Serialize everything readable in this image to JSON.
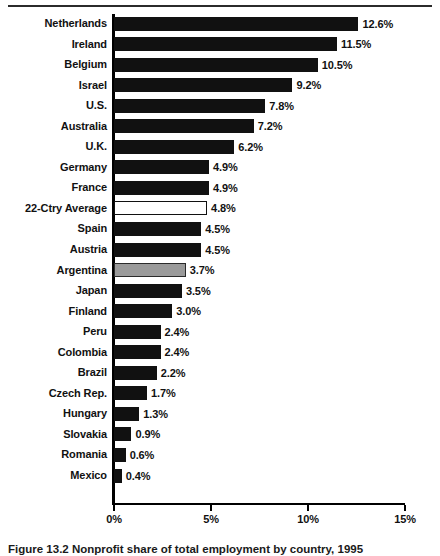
{
  "figure": {
    "caption": "Figure 13.2  Nonprofit share of total employment by country, 1995",
    "top_rule": "horizontal-rule",
    "bottom_rule": "horizontal-rule"
  },
  "chart_data": {
    "type": "bar",
    "orientation": "horizontal",
    "title": "",
    "subtitle": "",
    "xlabel": "",
    "ylabel": "",
    "xlim": [
      0,
      15
    ],
    "xticks": [
      0,
      5,
      10,
      15
    ],
    "xtick_labels": [
      "0%",
      "5%",
      "10%",
      "15%"
    ],
    "grid": false,
    "legend": "none",
    "value_suffix": "%",
    "categories": [
      "Netherlands",
      "Ireland",
      "Belgium",
      "Israel",
      "U.S.",
      "Australia",
      "U.K.",
      "Germany",
      "France",
      "22-Ctry Average",
      "Spain",
      "Austria",
      "Argentina",
      "Japan",
      "Finland",
      "Peru",
      "Colombia",
      "Brazil",
      "Czech Rep.",
      "Hungary",
      "Slovakia",
      "Romania",
      "Mexico"
    ],
    "values": [
      12.6,
      11.5,
      10.5,
      9.2,
      7.8,
      7.2,
      6.2,
      4.9,
      4.9,
      4.8,
      4.5,
      4.5,
      3.7,
      3.5,
      3.0,
      2.4,
      2.4,
      2.2,
      1.7,
      1.3,
      0.9,
      0.6,
      0.4
    ],
    "value_labels": [
      "12.6%",
      "11.5%",
      "10.5%",
      "9.2%",
      "7.8%",
      "7.2%",
      "6.2%",
      "4.9%",
      "4.9%",
      "4.8%",
      "4.5%",
      "4.5%",
      "3.7%",
      "3.5%",
      "3.0%",
      "2.4%",
      "2.4%",
      "2.2%",
      "1.7%",
      "1.3%",
      "0.9%",
      "0.6%",
      "0.4%"
    ],
    "bar_styles": [
      "solid",
      "solid",
      "solid",
      "solid",
      "solid",
      "solid",
      "solid",
      "solid",
      "solid",
      "open",
      "solid",
      "solid",
      "gray",
      "solid",
      "solid",
      "solid",
      "solid",
      "solid",
      "solid",
      "solid",
      "solid",
      "solid",
      "solid"
    ],
    "colors": {
      "bar_solid": "#111111",
      "bar_open_fill": "#ffffff",
      "bar_open_stroke": "#111111",
      "bar_gray_fill": "#9a9a9a",
      "bar_gray_stroke": "#2a2a2a",
      "axis": "#000000",
      "text": "#111111",
      "background": "#ffffff"
    }
  }
}
